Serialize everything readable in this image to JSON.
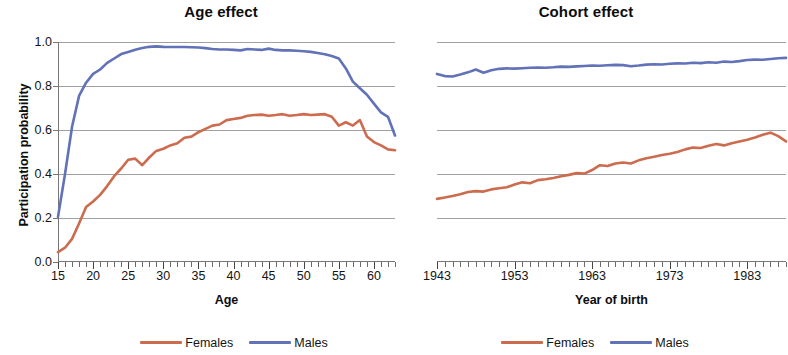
{
  "figure": {
    "series_colors": {
      "females": "#cc6b4e",
      "males": "#6272b8"
    },
    "grid": "horizontal"
  },
  "panels": {
    "age": {
      "title": "Age effect",
      "ylabel": "Participation probability",
      "xlabel": "Age",
      "yticks": [
        "0.0",
        "0.2",
        "0.4",
        "0.6",
        "0.8",
        "1.0"
      ],
      "xticks": [
        "15",
        "20",
        "25",
        "30",
        "35",
        "40",
        "45",
        "50",
        "55",
        "60"
      ],
      "legend": [
        {
          "label": "Females",
          "color": "#cc6b4e"
        },
        {
          "label": "Males",
          "color": "#6272b8"
        }
      ]
    },
    "cohort": {
      "title": "Cohort effect",
      "xlabel": "Year of birth",
      "xticks": [
        "1943",
        "1953",
        "1963",
        "1973",
        "1983"
      ],
      "legend": [
        {
          "label": "Females",
          "color": "#cc6b4e"
        },
        {
          "label": "Males",
          "color": "#6272b8"
        }
      ]
    }
  },
  "chart_data": [
    {
      "type": "line",
      "title": "Age effect",
      "xlabel": "Age",
      "ylabel": "Participation probability",
      "xlim": [
        15,
        63
      ],
      "ylim": [
        0.0,
        1.0
      ],
      "ytick_values": [
        0.0,
        0.2,
        0.4,
        0.6,
        0.8,
        1.0
      ],
      "xtick_values": [
        15,
        20,
        25,
        30,
        35,
        40,
        45,
        50,
        55,
        60
      ],
      "grid": "horizontal",
      "legend_position": "bottom",
      "x": [
        15,
        16,
        17,
        18,
        19,
        20,
        21,
        22,
        23,
        24,
        25,
        26,
        27,
        28,
        29,
        30,
        31,
        32,
        33,
        34,
        35,
        36,
        37,
        38,
        39,
        40,
        41,
        42,
        43,
        44,
        45,
        46,
        47,
        48,
        49,
        50,
        51,
        52,
        53,
        54,
        55,
        56,
        57,
        58,
        59,
        60,
        61,
        62,
        63
      ],
      "series": [
        {
          "name": "Males",
          "color": "#6272b8",
          "values": [
            0.205,
            0.4,
            0.615,
            0.755,
            0.815,
            0.855,
            0.875,
            0.905,
            0.925,
            0.945,
            0.955,
            0.965,
            0.973,
            0.978,
            0.98,
            0.978,
            0.977,
            0.977,
            0.977,
            0.976,
            0.975,
            0.972,
            0.968,
            0.966,
            0.966,
            0.964,
            0.962,
            0.968,
            0.966,
            0.964,
            0.97,
            0.964,
            0.962,
            0.962,
            0.96,
            0.958,
            0.955,
            0.95,
            0.944,
            0.936,
            0.925,
            0.88,
            0.82,
            0.79,
            0.76,
            0.72,
            0.68,
            0.66,
            0.575
          ]
        },
        {
          "name": "Females",
          "color": "#cc6b4e",
          "values": [
            0.045,
            0.065,
            0.105,
            0.175,
            0.25,
            0.275,
            0.305,
            0.345,
            0.39,
            0.425,
            0.465,
            0.47,
            0.44,
            0.475,
            0.505,
            0.515,
            0.53,
            0.54,
            0.565,
            0.57,
            0.59,
            0.605,
            0.62,
            0.625,
            0.645,
            0.65,
            0.655,
            0.665,
            0.668,
            0.67,
            0.665,
            0.668,
            0.672,
            0.665,
            0.668,
            0.672,
            0.668,
            0.67,
            0.672,
            0.66,
            0.62,
            0.635,
            0.62,
            0.645,
            0.57,
            0.545,
            0.53,
            0.512,
            0.508
          ]
        }
      ]
    },
    {
      "type": "line",
      "title": "Cohort effect",
      "xlabel": "Year of birth",
      "ylabel": "Participation probability",
      "xlim": [
        1943,
        1988
      ],
      "ylim": [
        0.0,
        1.0
      ],
      "ytick_values": [
        0.0,
        0.2,
        0.4,
        0.6,
        0.8,
        1.0
      ],
      "xtick_values": [
        1943,
        1953,
        1963,
        1973,
        1983
      ],
      "grid": "horizontal",
      "legend_position": "bottom",
      "x": [
        1943,
        1944,
        1945,
        1946,
        1947,
        1948,
        1949,
        1950,
        1951,
        1952,
        1953,
        1954,
        1955,
        1956,
        1957,
        1958,
        1959,
        1960,
        1961,
        1962,
        1963,
        1964,
        1965,
        1966,
        1967,
        1968,
        1969,
        1970,
        1971,
        1972,
        1973,
        1974,
        1975,
        1976,
        1977,
        1978,
        1979,
        1980,
        1981,
        1982,
        1983,
        1984,
        1985,
        1986,
        1987,
        1988
      ],
      "series": [
        {
          "name": "Males",
          "color": "#6272b8",
          "values": [
            0.855,
            0.845,
            0.843,
            0.852,
            0.862,
            0.875,
            0.86,
            0.872,
            0.878,
            0.88,
            0.879,
            0.881,
            0.883,
            0.884,
            0.883,
            0.885,
            0.888,
            0.887,
            0.889,
            0.891,
            0.893,
            0.892,
            0.894,
            0.896,
            0.895,
            0.89,
            0.893,
            0.897,
            0.899,
            0.898,
            0.901,
            0.903,
            0.902,
            0.906,
            0.904,
            0.908,
            0.906,
            0.911,
            0.909,
            0.913,
            0.918,
            0.92,
            0.919,
            0.923,
            0.926,
            0.928
          ]
        },
        {
          "name": "Females",
          "color": "#cc6b4e",
          "values": [
            0.287,
            0.293,
            0.3,
            0.308,
            0.318,
            0.322,
            0.32,
            0.33,
            0.335,
            0.34,
            0.352,
            0.362,
            0.358,
            0.372,
            0.376,
            0.382,
            0.39,
            0.396,
            0.404,
            0.402,
            0.418,
            0.44,
            0.436,
            0.448,
            0.452,
            0.448,
            0.462,
            0.472,
            0.478,
            0.486,
            0.492,
            0.5,
            0.512,
            0.52,
            0.518,
            0.528,
            0.536,
            0.53,
            0.54,
            0.548,
            0.556,
            0.566,
            0.578,
            0.588,
            0.572,
            0.548
          ]
        }
      ]
    }
  ]
}
